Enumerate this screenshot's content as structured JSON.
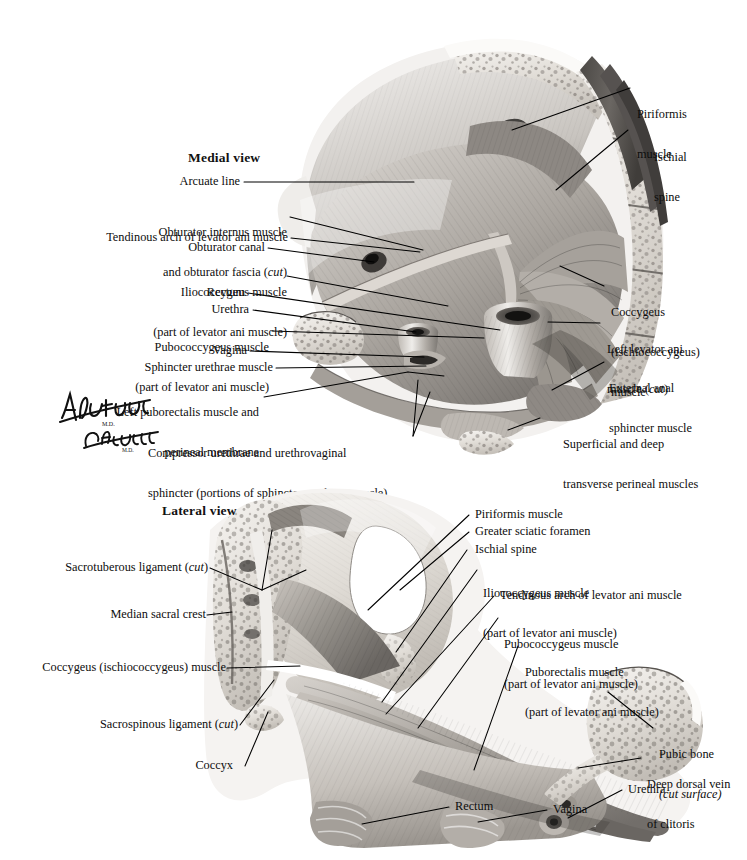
{
  "figure": {
    "domain": "anatomical-illustration",
    "background_color": "#ffffff",
    "ink_color": "#0d0d0d",
    "panels": [
      {
        "id": "medial",
        "title": "Medial view"
      },
      {
        "id": "lateral",
        "title": "Lateral view"
      }
    ]
  },
  "signature": {
    "artist_primary": "F. Netter",
    "artist_primary_suffix": "M.D.",
    "artist_secondary": "C. Machado",
    "artist_secondary_suffix": "M.D."
  },
  "medial": {
    "title": "Medial view",
    "labels_left": [
      {
        "id": "arcuate-line",
        "text": "Arcuate line"
      },
      {
        "id": "obturator-internus",
        "line1": "Obturator internus muscle",
        "line2_a": "and obturator fascia (",
        "line2_em": "cut",
        "line2_b": ")"
      },
      {
        "id": "tendinous-arch",
        "text": "Tendinous arch of levator ani muscle"
      },
      {
        "id": "obturator-canal",
        "text": "Obturator canal"
      },
      {
        "id": "iliococcygeus",
        "line1": "Iliococcygeus muscle",
        "line2": "(part of levator ani muscle)"
      },
      {
        "id": "rectum",
        "text": "Rectum"
      },
      {
        "id": "urethra",
        "text": "Urethra"
      },
      {
        "id": "pubococcygeus",
        "line1": "Pubococcygeus muscle",
        "line2": "(part of levator ani muscle)"
      },
      {
        "id": "vagina",
        "text": "Vagina"
      },
      {
        "id": "sphincter-urethrae",
        "text": "Sphincter urethrae muscle"
      },
      {
        "id": "left-puborectalis",
        "line1": "Left puborectalis muscle and",
        "line2": "perineal membrane"
      },
      {
        "id": "compressor-urethrae",
        "line1": "Compressor urethrae and urethrovaginal",
        "line2": "sphincter (portions of sphincter urethrae muscle)"
      }
    ],
    "labels_right": [
      {
        "id": "piriformis",
        "line1": "Piriformis",
        "line2": "muscle"
      },
      {
        "id": "ischial-spine",
        "line1": "Ischial",
        "line2": "spine"
      },
      {
        "id": "coccygeus",
        "line1": "Coccygeus",
        "line2": "(ischiococcygeus)",
        "line3": "muscle"
      },
      {
        "id": "left-levator-ani",
        "line1": "Left levator ani",
        "line2_a": "muscle (",
        "line2_em": "cut",
        "line2_b": ")"
      },
      {
        "id": "external-anal-sphincter",
        "line1": "External anal",
        "line2": "sphincter muscle"
      },
      {
        "id": "transverse-perineal",
        "line1": "Superficial and deep",
        "line2": "transverse perineal muscles"
      }
    ]
  },
  "lateral": {
    "title": "Lateral view",
    "labels_left": [
      {
        "id": "sacrotuberous-ligament",
        "text_a": "Sacrotuberous ligament (",
        "text_em": "cut",
        "text_b": ")"
      },
      {
        "id": "median-sacral-crest",
        "text": "Median sacral crest"
      },
      {
        "id": "coccygeus",
        "text": "Coccygeus (ischiococcygeus) muscle"
      },
      {
        "id": "sacrospinous-ligament",
        "text_a": "Sacrospinous ligament (",
        "text_em": "cut",
        "text_b": ")"
      },
      {
        "id": "coccyx",
        "text": "Coccyx"
      }
    ],
    "labels_right": [
      {
        "id": "piriformis",
        "text": "Piriformis muscle"
      },
      {
        "id": "greater-sciatic-foramen",
        "text": "Greater sciatic foramen"
      },
      {
        "id": "ischial-spine",
        "text": "Ischial spine"
      },
      {
        "id": "iliococcygeus",
        "line1": "Iliococcygeus muscle",
        "line2": "(part of levator ani muscle)"
      },
      {
        "id": "tendinous-arch",
        "text": "Tendinous arch of levator ani muscle"
      },
      {
        "id": "pubococcygeus",
        "line1": "Pubococcygeus muscle",
        "line2": "(part of levator ani muscle)"
      },
      {
        "id": "puborectalis",
        "line1": "Puborectalis muscle",
        "line2": "(part of levator ani muscle)"
      },
      {
        "id": "pubic-bone",
        "line1": "Pubic bone",
        "line2_em": "(cut surface)"
      },
      {
        "id": "deep-dorsal-vein",
        "line1": "Deep dorsal vein",
        "line2": "of clitoris"
      },
      {
        "id": "urethra",
        "text": "Urethra"
      }
    ],
    "labels_bottom": [
      {
        "id": "rectum",
        "text": "Rectum"
      },
      {
        "id": "vagina",
        "text": "Vagina"
      }
    ]
  }
}
